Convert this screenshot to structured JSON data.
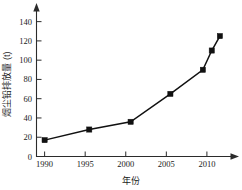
{
  "chart_data": {
    "type": "line",
    "title": "",
    "subtitle": "",
    "xlabel": "年份",
    "ylabel": "烟尘铅排放量 (t)",
    "xlim": [
      1989.0,
      2012.6
    ],
    "ylim": [
      0,
      150
    ],
    "grid": false,
    "legend": "none",
    "marker": "filled-square",
    "line_color": "#111111",
    "marker_color": "#111111",
    "axis_color": "#2b2b2b",
    "x_ticks": [
      1990,
      1995,
      2000,
      2005,
      2010
    ],
    "x_tick_labels": [
      "1990",
      "1995",
      "2000",
      "2005",
      "2010"
    ],
    "y_ticks": [
      0,
      20,
      40,
      60,
      80,
      100,
      120,
      140
    ],
    "y_tick_labels": [
      "0",
      "20",
      "40",
      "60",
      "80",
      "100",
      "120",
      "140"
    ],
    "series": [
      {
        "name": "烟尘铅排放量",
        "x": [
          1990.0,
          1995.5,
          2000.6,
          2005.5,
          2009.5,
          2010.6,
          2011.6
        ],
        "values": [
          17,
          28,
          36,
          65,
          90,
          110,
          125
        ]
      }
    ],
    "annotations": []
  },
  "figure": {
    "alt": "烟尘铅排放量随年份变化折线图"
  }
}
